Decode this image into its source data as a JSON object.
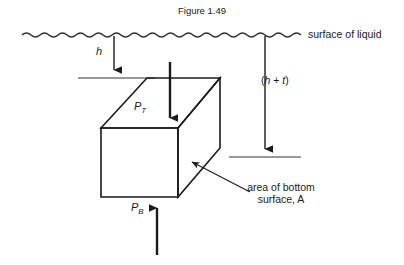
{
  "figure": {
    "caption": "Figure 1.49",
    "surface_label": "surface of liquid",
    "depth_h_label": "h",
    "depth_ht_label_open": "(",
    "depth_ht_label_h": "h",
    "depth_ht_label_plus": " + ",
    "depth_ht_label_t": "t",
    "depth_ht_label_close": ")",
    "pressure_top_symbol": "P",
    "pressure_top_subscript": "T",
    "pressure_bottom_symbol": "P",
    "pressure_bottom_subscript": "B",
    "area_label_line1": "area of bottom",
    "area_label_line2": "surface, A",
    "colors": {
      "ink": "#1a1a1a",
      "line": "#333333",
      "background": "#ffffff"
    }
  },
  "diagram": {
    "type": "physics-free-body-diagram",
    "elements": {
      "liquid_surface": "wavy horizontal line",
      "depth_arrow_h": "vertical down arrow from surface to top face level",
      "depth_arrow_h_plus_t": "vertical down arrow from surface to bottom face level",
      "block": "3D rectangular prism in oblique projection",
      "force_arrow_top": "down arrow onto top face",
      "force_arrow_bottom": "up arrow onto bottom face",
      "leader_line_area": "arrow pointing to bottom-right corner of block"
    }
  }
}
